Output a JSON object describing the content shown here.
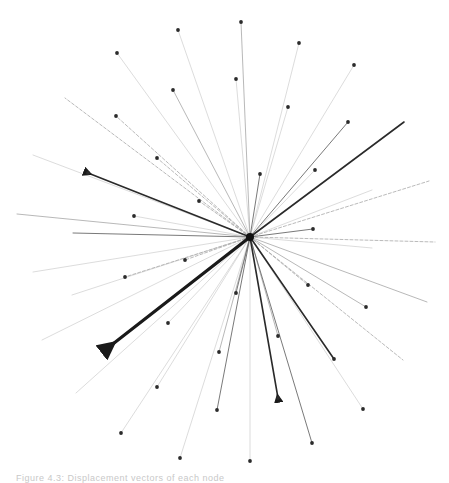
{
  "diagram": {
    "type": "radial-vector-graph",
    "center": [
      250,
      237
    ],
    "caption": "Figure 4.3: Displacement vectors of each node",
    "edges": [
      {
        "to": [
          117,
          53
        ],
        "style": "faint",
        "dot": true
      },
      {
        "to": [
          178,
          30
        ],
        "style": "faint",
        "dot": true
      },
      {
        "to": [
          173,
          90
        ],
        "style": "light",
        "dot": true
      },
      {
        "to": [
          116,
          116
        ],
        "style": "dashed",
        "dot": true
      },
      {
        "to": [
          157,
          158
        ],
        "style": "dashed",
        "dot": true
      },
      {
        "to": [
          199,
          201
        ],
        "style": "dashed",
        "dot": true
      },
      {
        "to": [
          134,
          216
        ],
        "style": "faint",
        "dot": true
      },
      {
        "to": [
          65,
          98
        ],
        "style": "dashed",
        "dot": false
      },
      {
        "to": [
          33,
          155
        ],
        "style": "faint",
        "dot": false
      },
      {
        "to": [
          17,
          214
        ],
        "style": "light",
        "dot": false
      },
      {
        "to": [
          73,
          233
        ],
        "style": "medium",
        "dot": false
      },
      {
        "to": [
          88,
          173
        ],
        "style": "bold",
        "dot": true,
        "arrow": true
      },
      {
        "to": [
          241,
          22
        ],
        "style": "light",
        "dot": true
      },
      {
        "to": [
          299,
          43
        ],
        "style": "faint",
        "dot": true
      },
      {
        "to": [
          236,
          79
        ],
        "style": "faint",
        "dot": true
      },
      {
        "to": [
          288,
          107
        ],
        "style": "faint",
        "dot": true
      },
      {
        "to": [
          354,
          65
        ],
        "style": "faint",
        "dot": true
      },
      {
        "to": [
          348,
          122
        ],
        "style": "medium",
        "dot": true
      },
      {
        "to": [
          404,
          122
        ],
        "style": "bold",
        "dot": false
      },
      {
        "to": [
          315,
          170
        ],
        "style": "faint",
        "dot": true
      },
      {
        "to": [
          260,
          174
        ],
        "style": "medium",
        "dot": true
      },
      {
        "to": [
          429,
          181
        ],
        "style": "dashed",
        "dot": false
      },
      {
        "to": [
          372,
          190
        ],
        "style": "faint",
        "dot": false
      },
      {
        "to": [
          313,
          229
        ],
        "style": "medium",
        "dot": true
      },
      {
        "to": [
          435,
          242
        ],
        "style": "dashed",
        "dot": false
      },
      {
        "to": [
          372,
          248
        ],
        "style": "faint",
        "dot": false
      },
      {
        "to": [
          427,
          302
        ],
        "style": "light",
        "dot": false
      },
      {
        "to": [
          366,
          307
        ],
        "style": "light",
        "dot": true
      },
      {
        "to": [
          308,
          285
        ],
        "style": "dashed",
        "dot": true
      },
      {
        "to": [
          403,
          360
        ],
        "style": "dashed",
        "dot": false
      },
      {
        "to": [
          334,
          359
        ],
        "style": "bold",
        "dot": true
      },
      {
        "to": [
          363,
          409
        ],
        "style": "faint",
        "dot": true
      },
      {
        "to": [
          278,
          398
        ],
        "style": "bold",
        "dot": true,
        "arrow": true
      },
      {
        "to": [
          278,
          336
        ],
        "style": "light",
        "dot": true
      },
      {
        "to": [
          312,
          443
        ],
        "style": "medium",
        "dot": true
      },
      {
        "to": [
          250,
          461
        ],
        "style": "faint",
        "dot": true
      },
      {
        "to": [
          217,
          410
        ],
        "style": "medium",
        "dot": true
      },
      {
        "to": [
          236,
          293
        ],
        "style": "medium",
        "dot": true
      },
      {
        "to": [
          219,
          352
        ],
        "style": "light",
        "dot": true
      },
      {
        "to": [
          180,
          458
        ],
        "style": "faint",
        "dot": true
      },
      {
        "to": [
          157,
          387
        ],
        "style": "faint",
        "dot": true
      },
      {
        "to": [
          121,
          433
        ],
        "style": "faint",
        "dot": true
      },
      {
        "to": [
          76,
          393
        ],
        "style": "faint",
        "dot": false
      },
      {
        "to": [
          168,
          323
        ],
        "style": "faint",
        "dot": true
      },
      {
        "to": [
          42,
          340
        ],
        "style": "faint",
        "dot": false
      },
      {
        "to": [
          125,
          277
        ],
        "style": "dashed",
        "dot": true
      },
      {
        "to": [
          185,
          260
        ],
        "style": "dashed",
        "dot": true
      },
      {
        "to": [
          33,
          272
        ],
        "style": "faint",
        "dot": false
      },
      {
        "to": [
          72,
          295
        ],
        "style": "faint",
        "dot": false
      },
      {
        "to": [
          109,
          347
        ],
        "style": "heavy",
        "dot": false,
        "arrow": true
      }
    ],
    "colors": {
      "bold": "#2a2a2a",
      "heavy": "#1a1a1a",
      "medium": "#6a6a6a",
      "light": "#9a9a9a",
      "faint": "#c4c4c4",
      "dashed": "#a8a8a8",
      "dot": "#2b2b2b"
    }
  }
}
